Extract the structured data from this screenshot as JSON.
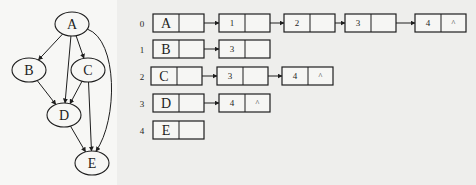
{
  "graph": {
    "nodes": [
      {
        "id": "A",
        "label": "A",
        "cx": 72,
        "cy": 24
      },
      {
        "id": "B",
        "label": "B",
        "cx": 29,
        "cy": 70
      },
      {
        "id": "C",
        "label": "C",
        "cx": 88,
        "cy": 70
      },
      {
        "id": "D",
        "label": "D",
        "cx": 64,
        "cy": 115
      },
      {
        "id": "E",
        "label": "E",
        "cx": 92,
        "cy": 163
      }
    ],
    "edges": [
      {
        "from": "A",
        "to": "B"
      },
      {
        "from": "A",
        "to": "C"
      },
      {
        "from": "A",
        "to": "D"
      },
      {
        "from": "A",
        "to": "E"
      },
      {
        "from": "B",
        "to": "D"
      },
      {
        "from": "C",
        "to": "D"
      },
      {
        "from": "C",
        "to": "E"
      },
      {
        "from": "D",
        "to": "E"
      }
    ]
  },
  "adjacency_list": {
    "null_symbol": "^",
    "rows": [
      {
        "index": "0",
        "vertex": "A",
        "neighbors": [
          "1",
          "2",
          "3",
          "4"
        ],
        "ends_with_null": true
      },
      {
        "index": "1",
        "vertex": "B",
        "neighbors": [
          "3"
        ],
        "ends_with_null": false
      },
      {
        "index": "2",
        "vertex": "C",
        "neighbors": [
          "3",
          "4"
        ],
        "ends_with_null": true
      },
      {
        "index": "3",
        "vertex": "D",
        "neighbors": [
          "4"
        ],
        "ends_with_null": true
      },
      {
        "index": "4",
        "vertex": "E",
        "neighbors": [],
        "ends_with_null": false
      }
    ]
  },
  "colors": {
    "ink": "#1e1e1e",
    "node_fill": "#f7f7f5",
    "box_fill": "#f6f6f4"
  }
}
